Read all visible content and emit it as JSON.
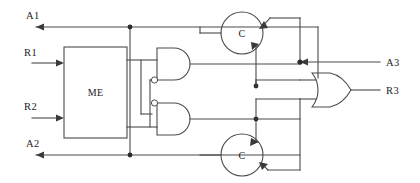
{
  "diagram": {
    "type": "logic-circuit-schematic",
    "width": 420,
    "height": 183,
    "background_color": "#ffffff",
    "line_color": "#4a4a4a",
    "text_color": "#1d1d1d"
  },
  "labels": {
    "a1": "A1",
    "r1": "R1",
    "r2": "R2",
    "a2": "A2",
    "a3": "A3",
    "r3": "R3"
  },
  "blocks": {
    "me": {
      "label": "ME",
      "x": 64,
      "y": 47,
      "width": 63,
      "height": 91
    }
  },
  "elements": {
    "c_top": {
      "label": "C",
      "cx": 242,
      "cy": 33,
      "r": 21
    },
    "c_bottom": {
      "label": "C",
      "cx": 242,
      "cy": 155,
      "r": 21
    },
    "and_top": {
      "name": "and-gate-top",
      "inverted_input": "bottom"
    },
    "and_bottom": {
      "name": "and-gate-bottom",
      "inverted_input": "top"
    },
    "or_gate": {
      "name": "or-gate"
    }
  },
  "signals": {
    "inputs": [
      "R1",
      "R2",
      "A3"
    ],
    "outputs": [
      "A1",
      "A2",
      "R3"
    ]
  }
}
